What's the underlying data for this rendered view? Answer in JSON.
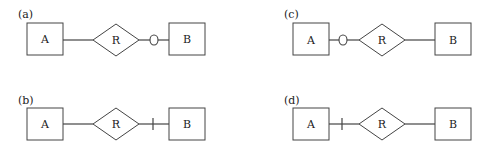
{
  "panels": {
    "a": {
      "label": "(a)",
      "entity_left": "A",
      "relationship": "R",
      "entity_right": "B",
      "marker": "circle",
      "marker_side": "right",
      "marker_glyph": "O"
    },
    "b": {
      "label": "(b)",
      "entity_left": "A",
      "relationship": "R",
      "entity_right": "B",
      "marker": "bar",
      "marker_side": "right"
    },
    "c": {
      "label": "(c)",
      "entity_left": "A",
      "relationship": "R",
      "entity_right": "B",
      "marker": "circle",
      "marker_side": "left",
      "marker_glyph": "O"
    },
    "d": {
      "label": "(d)",
      "entity_left": "A",
      "relationship": "R",
      "entity_right": "B",
      "marker": "bar",
      "marker_side": "left"
    }
  },
  "colors": {
    "stroke": "#444444",
    "text": "#222222",
    "background": "#ffffff"
  }
}
